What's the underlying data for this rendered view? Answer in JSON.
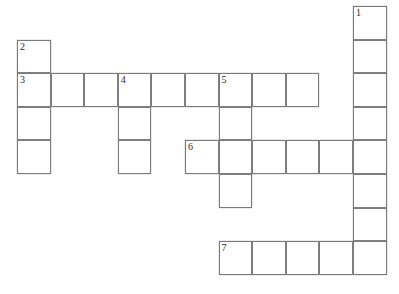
{
  "puzzle": {
    "kind": "crossword-grid",
    "title": "",
    "canvas": {
      "width": 399,
      "height": 294,
      "background": "#ffffff"
    },
    "style": {
      "cell_size": 33.6,
      "origin_x": 17,
      "origin_y": 6,
      "cell_fill": "#ffffff",
      "cell_border": "#7a7a7a",
      "number_color": "#2b2b2b"
    },
    "clue_numbers": [
      "1",
      "2",
      "3",
      "4",
      "5",
      "6",
      "7"
    ],
    "entries": [
      {
        "number": "1",
        "direction": "down",
        "row": 0,
        "col": 10,
        "length": 8
      },
      {
        "number": "2",
        "direction": "down",
        "row": 1,
        "col": 0,
        "length": 4
      },
      {
        "number": "3",
        "direction": "across",
        "row": 2,
        "col": 0,
        "length": 9
      },
      {
        "number": "4",
        "direction": "down",
        "row": 2,
        "col": 3,
        "length": 3
      },
      {
        "number": "5",
        "direction": "down",
        "row": 2,
        "col": 6,
        "length": 4
      },
      {
        "number": "6",
        "direction": "across",
        "row": 4,
        "col": 5,
        "length": 6
      },
      {
        "number": "7",
        "direction": "across",
        "row": 7,
        "col": 6,
        "length": 5
      }
    ],
    "cells": [
      {
        "row": 0,
        "col": 10,
        "number": "1",
        "letter": ""
      },
      {
        "row": 1,
        "col": 0,
        "number": "2",
        "letter": ""
      },
      {
        "row": 1,
        "col": 10,
        "number": "",
        "letter": ""
      },
      {
        "row": 2,
        "col": 0,
        "number": "3",
        "letter": ""
      },
      {
        "row": 2,
        "col": 1,
        "number": "",
        "letter": ""
      },
      {
        "row": 2,
        "col": 2,
        "number": "",
        "letter": ""
      },
      {
        "row": 2,
        "col": 3,
        "number": "4",
        "letter": ""
      },
      {
        "row": 2,
        "col": 4,
        "number": "",
        "letter": ""
      },
      {
        "row": 2,
        "col": 5,
        "number": "",
        "letter": ""
      },
      {
        "row": 2,
        "col": 6,
        "number": "5",
        "letter": ""
      },
      {
        "row": 2,
        "col": 7,
        "number": "",
        "letter": ""
      },
      {
        "row": 2,
        "col": 8,
        "number": "",
        "letter": ""
      },
      {
        "row": 2,
        "col": 10,
        "number": "",
        "letter": ""
      },
      {
        "row": 3,
        "col": 0,
        "number": "",
        "letter": ""
      },
      {
        "row": 3,
        "col": 3,
        "number": "",
        "letter": ""
      },
      {
        "row": 3,
        "col": 6,
        "number": "",
        "letter": ""
      },
      {
        "row": 3,
        "col": 10,
        "number": "",
        "letter": ""
      },
      {
        "row": 4,
        "col": 0,
        "number": "",
        "letter": ""
      },
      {
        "row": 4,
        "col": 3,
        "number": "",
        "letter": ""
      },
      {
        "row": 4,
        "col": 5,
        "number": "6",
        "letter": ""
      },
      {
        "row": 4,
        "col": 6,
        "number": "",
        "letter": ""
      },
      {
        "row": 4,
        "col": 7,
        "number": "",
        "letter": ""
      },
      {
        "row": 4,
        "col": 8,
        "number": "",
        "letter": ""
      },
      {
        "row": 4,
        "col": 9,
        "number": "",
        "letter": ""
      },
      {
        "row": 4,
        "col": 10,
        "number": "",
        "letter": ""
      },
      {
        "row": 5,
        "col": 6,
        "number": "",
        "letter": ""
      },
      {
        "row": 5,
        "col": 10,
        "number": "",
        "letter": ""
      },
      {
        "row": 6,
        "col": 10,
        "number": "",
        "letter": ""
      },
      {
        "row": 7,
        "col": 6,
        "number": "7",
        "letter": ""
      },
      {
        "row": 7,
        "col": 7,
        "number": "",
        "letter": ""
      },
      {
        "row": 7,
        "col": 8,
        "number": "",
        "letter": ""
      },
      {
        "row": 7,
        "col": 9,
        "number": "",
        "letter": ""
      },
      {
        "row": 7,
        "col": 10,
        "number": "",
        "letter": ""
      }
    ]
  }
}
